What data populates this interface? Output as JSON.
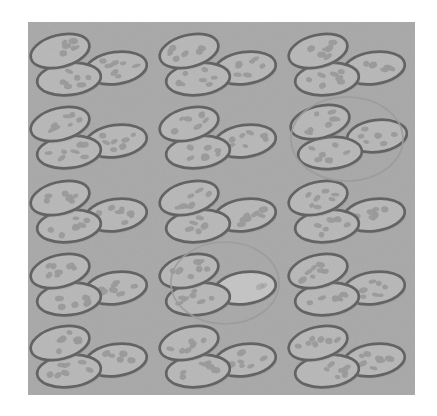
{
  "figure": {
    "panel_label_fragment": "A)",
    "caption": "",
    "kind": "micrograph-illustration"
  },
  "colors": {
    "page_background": "#ffffff",
    "panel_background": "#a8a8a8",
    "cell_fill": "#c6c6c6",
    "cell_fill_pale": "#dedede",
    "cell_outline": "#1c1c1c",
    "cell_spot": "#8a8a8a",
    "highlight_circle_stroke": "#8d8d8d"
  },
  "panel": {
    "x": 28,
    "y": 22,
    "width": 387,
    "height": 373,
    "grid_rows": 5,
    "grid_cols": 3,
    "cluster_count": 15,
    "cells_per_cluster": 3
  },
  "clusters": [
    {
      "id": "r1c1",
      "row": 1,
      "col": 1,
      "cx": 88,
      "cy": 65,
      "circled": false,
      "variant": "normal",
      "pale_cell": null
    },
    {
      "id": "r1c2",
      "row": 1,
      "col": 2,
      "cx": 217,
      "cy": 65,
      "circled": false,
      "variant": "normal",
      "pale_cell": null
    },
    {
      "id": "r1c3",
      "row": 1,
      "col": 3,
      "cx": 346,
      "cy": 65,
      "circled": false,
      "variant": "normal",
      "pale_cell": null
    },
    {
      "id": "r2c1",
      "row": 2,
      "col": 1,
      "cx": 88,
      "cy": 138,
      "circled": false,
      "variant": "normal",
      "pale_cell": null
    },
    {
      "id": "r2c2",
      "row": 2,
      "col": 2,
      "cx": 217,
      "cy": 138,
      "circled": false,
      "variant": "normal",
      "pale_cell": null
    },
    {
      "id": "r2c3",
      "row": 2,
      "col": 3,
      "cx": 346,
      "cy": 138,
      "circled": true,
      "variant": "spread",
      "pale_cell": null
    },
    {
      "id": "r3c1",
      "row": 3,
      "col": 1,
      "cx": 88,
      "cy": 212,
      "circled": false,
      "variant": "normal",
      "pale_cell": null
    },
    {
      "id": "r3c2",
      "row": 3,
      "col": 2,
      "cx": 217,
      "cy": 212,
      "circled": false,
      "variant": "normal",
      "pale_cell": null
    },
    {
      "id": "r3c3",
      "row": 3,
      "col": 3,
      "cx": 346,
      "cy": 212,
      "circled": false,
      "variant": "normal",
      "pale_cell": null
    },
    {
      "id": "r4c1",
      "row": 4,
      "col": 1,
      "cx": 88,
      "cy": 285,
      "circled": false,
      "variant": "normal",
      "pale_cell": null
    },
    {
      "id": "r4c2",
      "row": 4,
      "col": 2,
      "cx": 217,
      "cy": 285,
      "circled": true,
      "variant": "normal",
      "pale_cell": "right"
    },
    {
      "id": "r4c3",
      "row": 4,
      "col": 3,
      "cx": 346,
      "cy": 285,
      "circled": false,
      "variant": "normal",
      "pale_cell": null
    },
    {
      "id": "r5c1",
      "row": 5,
      "col": 1,
      "cx": 88,
      "cy": 357,
      "circled": false,
      "variant": "normal",
      "pale_cell": null
    },
    {
      "id": "r5c2",
      "row": 5,
      "col": 2,
      "cx": 217,
      "cy": 357,
      "circled": false,
      "variant": "normal",
      "pale_cell": null
    },
    {
      "id": "r5c3",
      "row": 5,
      "col": 3,
      "cx": 346,
      "cy": 357,
      "circled": false,
      "variant": "normal",
      "pale_cell": null
    }
  ],
  "highlight_circles": [
    {
      "id": "circle-r2c3",
      "cluster_id": "r2c3",
      "cx": 347,
      "cy": 139,
      "rx": 56,
      "ry": 42
    },
    {
      "id": "circle-r4c2",
      "cluster_id": "r4c2",
      "cx": 225,
      "cy": 283,
      "rx": 54,
      "ry": 41
    }
  ],
  "cell_geometry": {
    "top_left": {
      "dx": -28,
      "dy": -14,
      "rx": 30,
      "ry": 16,
      "rot": -14
    },
    "bottom_left": {
      "dx": -19,
      "dy": 14,
      "rx": 32,
      "ry": 16,
      "rot": -6
    },
    "right": {
      "dx": 28,
      "dy": 3,
      "rx": 31,
      "ry": 16,
      "rot": -8
    }
  },
  "cell_geometry_spread": {
    "top_left": {
      "dx": -26,
      "dy": -16,
      "rx": 30,
      "ry": 16,
      "rot": -14
    },
    "bottom_left": {
      "dx": -16,
      "dy": 15,
      "rx": 32,
      "ry": 16,
      "rot": -4
    },
    "right": {
      "dx": 31,
      "dy": -2,
      "rx": 30,
      "ry": 16,
      "rot": -7
    }
  },
  "spot_pattern": {
    "spots_per_cell_typical": 7,
    "spots_pale_cell": 2,
    "spot_rx": 3.6,
    "spot_ry": 2.4
  }
}
